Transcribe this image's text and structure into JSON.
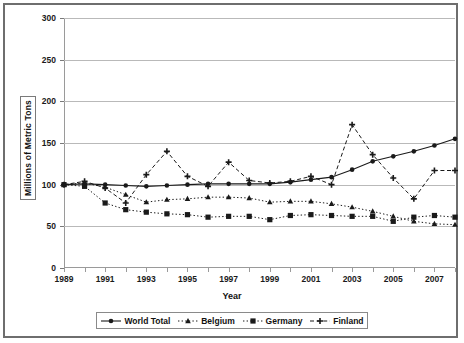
{
  "chart_data": {
    "type": "line",
    "title": "",
    "xlabel": "Year",
    "ylabel": "Millions of Metric Tons",
    "xlim": [
      1989,
      2008
    ],
    "ylim": [
      0,
      300
    ],
    "yticks": [
      0,
      50,
      100,
      150,
      200,
      250,
      300
    ],
    "xticks": [
      1989,
      1991,
      1993,
      1995,
      1997,
      1999,
      2001,
      2003,
      2005,
      2007
    ],
    "x": [
      1989,
      1990,
      1991,
      1992,
      1993,
      1994,
      1995,
      1996,
      1997,
      1998,
      1999,
      2000,
      2001,
      2002,
      2003,
      2004,
      2005,
      2006,
      2007,
      2008
    ],
    "grid": true,
    "legend_position": "bottom",
    "series": [
      {
        "name": "World Total",
        "marker": "circle",
        "line_style": "solid",
        "color": "#1a1a1a",
        "values": [
          100,
          101,
          100,
          99,
          98,
          99,
          100,
          101,
          101,
          101,
          101,
          103,
          106,
          109,
          118,
          128,
          134,
          140,
          147,
          155
        ]
      },
      {
        "name": "Belgium",
        "marker": "triangle",
        "line_style": "dotted",
        "color": "#1a1a1a",
        "values": [
          100,
          102,
          97,
          88,
          79,
          82,
          83,
          85,
          85,
          84,
          79,
          80,
          80,
          77,
          73,
          68,
          62,
          56,
          53,
          52
        ]
      },
      {
        "name": "Germany",
        "marker": "square",
        "line_style": "dotted",
        "color": "#1a1a1a",
        "values": [
          100,
          98,
          78,
          70,
          67,
          65,
          64,
          61,
          62,
          62,
          58,
          63,
          64,
          63,
          62,
          62,
          56,
          61,
          63,
          61
        ]
      },
      {
        "name": "Finland",
        "marker": "plus",
        "line_style": "dashed",
        "color": "#1a1a1a",
        "values": [
          100,
          104,
          96,
          78,
          112,
          140,
          110,
          98,
          127,
          105,
          102,
          104,
          110,
          100,
          172,
          136,
          108,
          83,
          117,
          117
        ]
      }
    ]
  },
  "axis": {
    "y_tick_labels": [
      "300",
      "250",
      "200",
      "150",
      "100",
      "50",
      "0"
    ],
    "x_tick_labels": [
      "1989",
      "1991",
      "1993",
      "1995",
      "1997",
      "1999",
      "2001",
      "2003",
      "2005",
      "2007"
    ],
    "x_title": "Year",
    "y_title": "Millions of Metric Tons"
  },
  "legend": {
    "items": [
      {
        "label": "World Total"
      },
      {
        "label": "Belgium"
      },
      {
        "label": "Germany"
      },
      {
        "label": "Finland"
      }
    ]
  }
}
